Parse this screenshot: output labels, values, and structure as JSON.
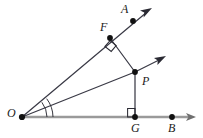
{
  "figure": {
    "type": "geometry-diagram",
    "width": 203,
    "height": 138,
    "background": "#ffffff",
    "colors": {
      "ray_dark": "#3a3a46",
      "baseline_gray": "#9a9a9a",
      "point_fill": "#111111",
      "label_text": "#1a1a1a",
      "marker_stroke": "#2a2a33"
    },
    "points": [
      {
        "name": "O",
        "label": "O",
        "x": 22,
        "y": 117,
        "label_x": 7,
        "label_y": 108,
        "dot": true
      },
      {
        "name": "F",
        "label": "F",
        "x": 110,
        "y": 38,
        "label_x": 99,
        "label_y": 21,
        "dot": true
      },
      {
        "name": "A",
        "label": "A",
        "x": 133,
        "y": 21,
        "label_x": 121,
        "label_y": 4,
        "dot": true
      },
      {
        "name": "P",
        "label": "P",
        "x": 135,
        "y": 72,
        "label_x": 142,
        "label_y": 74,
        "dot": true
      },
      {
        "name": "G",
        "label": "G",
        "x": 135,
        "y": 117,
        "label_x": 131,
        "label_y": 123,
        "dot": true
      },
      {
        "name": "B",
        "label": "B",
        "x": 172,
        "y": 117,
        "label_x": 169,
        "label_y": 123,
        "dot": true
      }
    ],
    "rays": [
      {
        "name": "ray-OA",
        "from": "O",
        "through": "F",
        "to_tip_x": 151,
        "to_tip_y": 9,
        "arrow": true,
        "color": "#3a3a46"
      },
      {
        "name": "ray-PA-parallel",
        "from": "P",
        "to_tip_x": 165,
        "to_tip_y": 56,
        "arrow": true,
        "color": "#3a3a46"
      },
      {
        "name": "ray-OB",
        "from": "O",
        "to_tip_x": 196,
        "to_tip_y": 117,
        "arrow": true,
        "color": "#9a9a9a"
      }
    ],
    "segments": [
      {
        "name": "segment-OP",
        "from": "O",
        "to": "P",
        "color": "#3a3a46"
      },
      {
        "name": "segment-FP",
        "from": "F",
        "to": "P",
        "color": "#3a3a46"
      },
      {
        "name": "segment-PG",
        "from": "P",
        "to": "G",
        "color": "#3a3a46"
      }
    ],
    "markers": [
      {
        "name": "right-angle-at-F",
        "kind": "right-angle-square",
        "at": "F"
      },
      {
        "name": "right-angle-at-G",
        "kind": "right-angle-square",
        "at": "G"
      },
      {
        "name": "angle-arcs-at-O",
        "kind": "double-arc",
        "at": "O",
        "arc_count": 2
      }
    ],
    "notes": {
      "description": "Angle AOB with vertex O; ray OA passes through F, ray OB passes through G to B; P lies on the bisector-like middle ray from O; PF perpendicular to OA; PG perpendicular to OB; a ray from P is parallel to OA."
    }
  }
}
